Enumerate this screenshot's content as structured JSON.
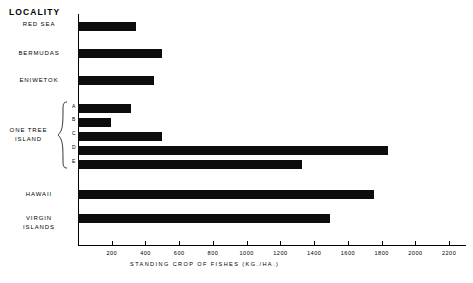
{
  "chart_data": {
    "type": "bar",
    "orientation": "horizontal",
    "title": "",
    "xlabel": "STANDING CROP OF FISHES (KG./HA.)",
    "ylabel": "LOCALITY",
    "xlim": [
      0,
      2300
    ],
    "xticks": [
      200,
      400,
      600,
      800,
      1000,
      1200,
      1400,
      1600,
      1800,
      2000,
      2200
    ],
    "grid": false,
    "legend": null,
    "categories": [
      "RED SEA",
      "BERMUDAS",
      "ENIWETOK",
      "A",
      "B",
      "C",
      "D",
      "E",
      "HAWAII",
      "VIRGIN ISLANDS"
    ],
    "values": [
      345,
      495,
      450,
      315,
      195,
      495,
      1840,
      1325,
      1755,
      1495
    ],
    "group_label": "ONE TREE ISLAND",
    "group_members": [
      "A",
      "B",
      "C",
      "D",
      "E"
    ]
  },
  "axis": {
    "y_header": "LOCALITY",
    "x_title": "STANDING CROP OF FISHES  (KG./HA.)",
    "tick_labels": [
      "200",
      "400",
      "600",
      "800",
      "1000",
      "1200",
      "1400",
      "1600",
      "1800",
      "2000",
      "2200"
    ]
  },
  "labels": {
    "red_sea": "RED SEA",
    "bermudas": "BERMUDAS",
    "eniwetok": "ENIWETOK",
    "one_tree_island_line1": "ONE TREE",
    "one_tree_island_line2": "ISLAND",
    "sub_a": "A",
    "sub_b": "B",
    "sub_c": "C",
    "sub_d": "D",
    "sub_e": "E",
    "hawaii": "HAWAII",
    "virgin_islands_line1": "VIRGIN",
    "virgin_islands_line2": "ISLANDS"
  },
  "colors": {
    "bar": "#0d0d0d",
    "axis": "#000000",
    "background": "#ffffff"
  }
}
